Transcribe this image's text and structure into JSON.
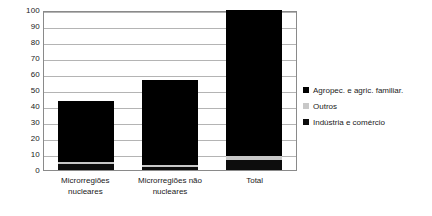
{
  "chart_data": {
    "type": "bar",
    "subtype": "stacked-column",
    "title": "",
    "xlabel": "",
    "ylabel": "",
    "ylim": [
      0,
      100
    ],
    "ytick_step": 10,
    "yticks": [
      100,
      90,
      80,
      70,
      60,
      50,
      40,
      30,
      20,
      10,
      0
    ],
    "grid": true,
    "legend_position": "right",
    "categories": [
      "Microrregiões nucleares",
      "Microrregiões não nucleares",
      "Total"
    ],
    "series": [
      {
        "name": "Indústria e comércio",
        "color": "#0d0d0d",
        "values": [
          3.5,
          2.0,
          6.5
        ]
      },
      {
        "name": "Outros",
        "color": "#c8c8c8",
        "values": [
          1.5,
          1.0,
          2.5
        ]
      },
      {
        "name": "Agropec. e agric. familiar.",
        "color": "#000000",
        "values": [
          38.0,
          53.0,
          91.0
        ]
      }
    ],
    "totals": [
      43,
      56,
      100
    ]
  },
  "axis": {
    "y_ticks": [
      "100",
      "90",
      "80",
      "70",
      "60",
      "50",
      "40",
      "30",
      "20",
      "10",
      "0"
    ],
    "x_labels": [
      {
        "line1": "Microrregiões",
        "line2": "nucleares"
      },
      {
        "line1": "Microrregiões não",
        "line2": "nucleares"
      },
      {
        "line1": "Total",
        "line2": ""
      }
    ]
  },
  "legend": {
    "items": [
      {
        "label": "Agropec. e agric. familiar.",
        "color": "#000000",
        "swatch": "square-swatch"
      },
      {
        "label": "Outros",
        "color": "#c8c8c8",
        "swatch": "square-swatch"
      },
      {
        "label": "Indústria e comércio",
        "color": "#0d0d0d",
        "swatch": "square-swatch"
      }
    ]
  }
}
